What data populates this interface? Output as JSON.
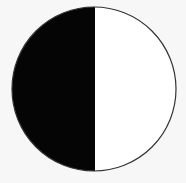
{
  "figure": {
    "type": "half-shaded-circle",
    "circle": {
      "cx": 94,
      "cy": 89,
      "r": 82
    },
    "divider_x": 95,
    "colors": {
      "background": "#f7f7f7",
      "filled_half": "#050505",
      "empty_half": "#ffffff",
      "outline": "#333333"
    },
    "filled_side": "left",
    "filled_fraction": 0.5
  }
}
